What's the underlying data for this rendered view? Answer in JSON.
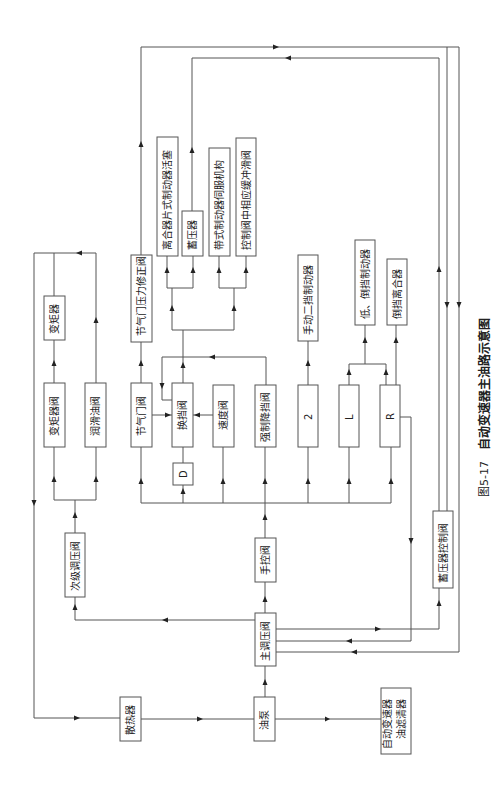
{
  "figure": {
    "number": "图5-17",
    "title": "自动变速器主油路示意图"
  },
  "nodes": {
    "radiator": "散热器",
    "oil_pump": "油泵",
    "filter_line1": "自动变速器",
    "filter_line2": "油滤清器",
    "main_pressure_valve": "主调压阀",
    "secondary_pressure_valve": "次级调压阀",
    "manual_valve": "手控阀",
    "converter_valve": "变矩器阀",
    "lube_valve": "润滑油阀",
    "torque_converter": "变矩器",
    "throttle_valve": "节气门阀",
    "shift_valve": "换挡阀",
    "governor_valve": "速度阀",
    "kickdown_valve": "强制降挡阀",
    "range_d": "D",
    "range_2": "2",
    "range_l": "L",
    "range_r": "R",
    "throttle_modulator_valve": "节气门压力修正阀",
    "clutch_brake_piston": "离合器片式制动器活塞",
    "accumulator": "蓄压器",
    "band_servo": "带式制动器伺服机构",
    "buffer_valve": "控制阀中相应缓冲滑阀",
    "manual_second_brake": "手动二挡制动器",
    "low_reverse_brake": "低、倒挡制动器",
    "reverse_clutch": "倒挡离合器",
    "accumulator_control_valve": "蓄压器控制阀"
  }
}
